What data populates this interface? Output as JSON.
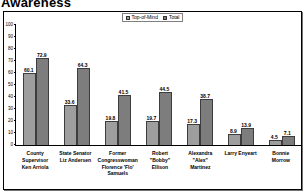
{
  "title": "Awareness",
  "chart_data": {
    "type": "bar",
    "title": "Awareness",
    "categories": [
      "County Supervisor Ken Arriola",
      "State Senator Liz Andersen",
      "Former Congresswoman Florence 'Flo' Samuels",
      "Robert \"Bobby\" Ellison",
      "Alexandra \"Alex\" Martinez",
      "Larry Enyeart",
      "Bonnie Morrow"
    ],
    "series": [
      {
        "name": "Top-of-Mind",
        "values": [
          60.1,
          33.6,
          19.8,
          19.7,
          17.3,
          8.9,
          4.5
        ]
      },
      {
        "name": "Total",
        "values": [
          72.9,
          64.3,
          41.5,
          44.5,
          38.7,
          13.9,
          7.1
        ]
      }
    ],
    "ylim": [
      0,
      100
    ],
    "ytick_step": 10,
    "grid": false,
    "legend_position": "top-center",
    "colors": [
      "#9e9e9e",
      "#7d7d7d"
    ]
  }
}
